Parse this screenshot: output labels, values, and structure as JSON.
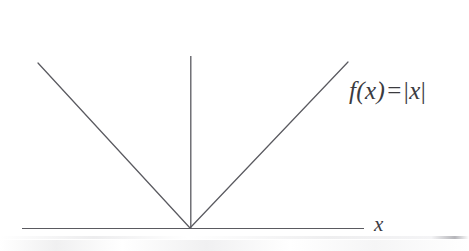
{
  "figure": {
    "canvas": {
      "width": 469,
      "height": 251,
      "background": "#ffffff"
    },
    "line_color": "#5a5a60",
    "text_color": "#3b3b3f",
    "line_width": 1.2,
    "labels": {
      "formula_f": "f",
      "formula_open_paren": "(",
      "formula_arg": "x",
      "formula_close_paren": ")",
      "formula_equals": "=",
      "formula_bar_left": "|",
      "formula_abs_arg": "x",
      "formula_bar_right": "|",
      "formula_full": "f(x) = |x|",
      "x_axis": "x"
    }
  },
  "chart_data": {
    "type": "line",
    "xlabel": "x",
    "ylabel": "",
    "function": "absolute value",
    "grid": false,
    "legend": false,
    "axes": {
      "x_axis": {
        "label": "x",
        "pixel_start": [
          22,
          228
        ],
        "pixel_end": [
          364,
          228
        ],
        "arrowhead": false,
        "ticks": [],
        "tick_labels": []
      },
      "y_axis": {
        "label": "",
        "pixel_start": [
          191,
          56
        ],
        "pixel_end": [
          191,
          228
        ],
        "arrowhead": false,
        "ticks": [],
        "tick_labels": []
      }
    },
    "origin_pixel": [
      190,
      228
    ],
    "series": [
      {
        "name": "f(x) = |x|",
        "points_pixel": [
          [
            38,
            63
          ],
          [
            190,
            228
          ],
          [
            348,
            62
          ]
        ],
        "x": [
          -1.0,
          0.0,
          1.04
        ],
        "values": [
          1.0,
          0.0,
          1.04
        ],
        "vertex": [
          0,
          0
        ],
        "left_slope": -1,
        "right_slope": 1
      }
    ],
    "annotations": [
      {
        "text": "f(x) = |x|",
        "pixel": [
          349,
          78
        ],
        "style": "italic-serif"
      },
      {
        "text": "x",
        "pixel": [
          374,
          214
        ],
        "style": "italic-serif"
      }
    ]
  }
}
